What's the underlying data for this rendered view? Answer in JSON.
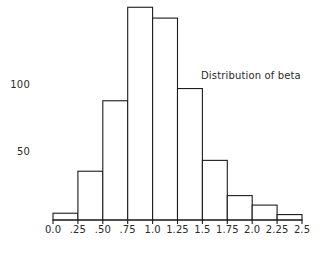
{
  "chart_data": {
    "type": "bar",
    "title": "",
    "annotation": "Distribution of beta",
    "xlabel": "",
    "ylabel": "",
    "bin_edges": [
      0.0,
      0.25,
      0.5,
      0.75,
      1.0,
      1.25,
      1.5,
      1.75,
      2.0,
      2.25,
      2.5
    ],
    "xtick_labels": [
      "0.0",
      ".25",
      ".50",
      ".75",
      "1.0",
      "1.25",
      "1.5",
      "1.75",
      "2.0",
      "2.25",
      "2.5"
    ],
    "ytick_labels": [
      "50",
      "100"
    ],
    "ytick_values": [
      50,
      100
    ],
    "categories": [
      "0.0-.25",
      ".25-.50",
      ".50-.75",
      ".75-1.0",
      "1.0-1.25",
      "1.25-1.5",
      "1.5-1.75",
      "1.75-2.0",
      "2.0-2.25",
      "2.25-2.5"
    ],
    "values": [
      5,
      36,
      88,
      157,
      149,
      97,
      44,
      18,
      11,
      4
    ],
    "xlim": [
      0.0,
      2.5
    ],
    "ylim": [
      0,
      160
    ],
    "grid": false,
    "legend": "none",
    "bar_fill": "#ffffff",
    "bar_stroke": "#1c1c1c",
    "text_color": "#2b2b2b",
    "background": "#ffffff"
  },
  "axis": {
    "y_labels": [
      {
        "text": "100",
        "value": 100
      },
      {
        "text": "50",
        "value": 50
      }
    ],
    "x_labels": [
      {
        "text": "0.0",
        "value": 0.0
      },
      {
        "text": ".25",
        "value": 0.25
      },
      {
        "text": ".50",
        "value": 0.5
      },
      {
        "text": ".75",
        "value": 0.75
      },
      {
        "text": "1.0",
        "value": 1.0
      },
      {
        "text": "1.25",
        "value": 1.25
      },
      {
        "text": "1.5",
        "value": 1.5
      },
      {
        "text": "1.75",
        "value": 1.75
      },
      {
        "text": "2.0",
        "value": 2.0
      },
      {
        "text": "2.25",
        "value": 2.25
      },
      {
        "text": "2.5",
        "value": 2.5
      }
    ]
  },
  "annotation": {
    "text": "Distribution of beta"
  }
}
